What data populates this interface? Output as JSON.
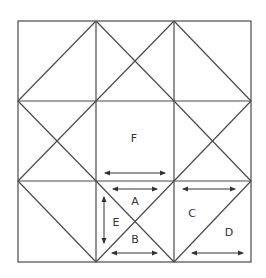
{
  "diagram": {
    "type": "quilt-block-geometry",
    "bounds": {
      "x1": 18,
      "y1": 21,
      "x2": 251,
      "y2": 262
    },
    "grid": {
      "xs": [
        18,
        96,
        174,
        251
      ],
      "ys": [
        21,
        101,
        181,
        262
      ]
    },
    "colors": {
      "line": "#4a4a4a",
      "arrow": "#333333",
      "label": "#333333",
      "background": "#ffffff"
    },
    "labels": [
      {
        "id": "F",
        "text": "F",
        "x": 134,
        "y": 138
      },
      {
        "id": "A",
        "text": "A",
        "x": 135,
        "y": 201
      },
      {
        "id": "E",
        "text": "E",
        "x": 116,
        "y": 222
      },
      {
        "id": "B",
        "text": "B",
        "x": 135,
        "y": 239
      },
      {
        "id": "C",
        "text": "C",
        "x": 192,
        "y": 213
      },
      {
        "id": "D",
        "text": "D",
        "x": 229,
        "y": 232
      }
    ],
    "arrows": [
      {
        "id": "arrow-F",
        "orientation": "horizontal",
        "x1": 105,
        "y1": 173,
        "x2": 165,
        "y2": 173
      },
      {
        "id": "arrow-A",
        "orientation": "horizontal",
        "x1": 113,
        "y1": 189,
        "x2": 157,
        "y2": 189
      },
      {
        "id": "arrow-E",
        "orientation": "vertical",
        "x1": 104,
        "y1": 197,
        "x2": 104,
        "y2": 243
      },
      {
        "id": "arrow-B",
        "orientation": "horizontal",
        "x1": 112,
        "y1": 253,
        "x2": 157,
        "y2": 253
      },
      {
        "id": "arrow-C",
        "orientation": "horizontal",
        "x1": 183,
        "y1": 189,
        "x2": 235,
        "y2": 189
      },
      {
        "id": "arrow-D",
        "orientation": "horizontal",
        "x1": 192,
        "y1": 253,
        "x2": 243,
        "y2": 253
      }
    ]
  }
}
